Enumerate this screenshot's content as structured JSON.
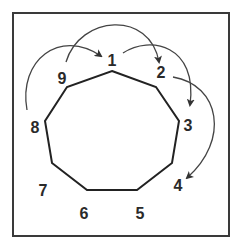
{
  "diagram": {
    "frame": {
      "x": 13,
      "y": 13,
      "width": 216,
      "height": 223,
      "stroke": "#3a3a3a"
    },
    "polygon": {
      "stroke": "#222222",
      "vertices": [
        {
          "id": "1",
          "x": 112,
          "y": 71
        },
        {
          "id": "2",
          "x": 156,
          "y": 87
        },
        {
          "id": "3",
          "x": 179,
          "y": 121
        },
        {
          "id": "4",
          "x": 172,
          "y": 163
        },
        {
          "id": "5",
          "x": 137,
          "y": 190
        },
        {
          "id": "6",
          "x": 87,
          "y": 190
        },
        {
          "id": "7",
          "x": 52,
          "y": 163
        },
        {
          "id": "8",
          "x": 45,
          "y": 121
        },
        {
          "id": "9",
          "x": 67,
          "y": 87
        }
      ]
    },
    "labels": [
      {
        "text": "1",
        "x": 112,
        "y": 66
      },
      {
        "text": "2",
        "x": 161,
        "y": 78
      },
      {
        "text": "3",
        "x": 188,
        "y": 131
      },
      {
        "text": "4",
        "x": 178,
        "y": 191
      },
      {
        "text": "5",
        "x": 140,
        "y": 219
      },
      {
        "text": "6",
        "x": 84,
        "y": 219
      },
      {
        "text": "7",
        "x": 43,
        "y": 196
      },
      {
        "text": "8",
        "x": 35,
        "y": 133
      },
      {
        "text": "9",
        "x": 62,
        "y": 84
      }
    ],
    "arrows": [
      {
        "from": "8",
        "to": "1",
        "path": "M 27 110 C 18 60, 60 28, 101 56"
      },
      {
        "from": "9",
        "to": "2",
        "path": "M 66 62 C 80 15, 150 10, 159 62"
      },
      {
        "from": "1",
        "to": "3",
        "path": "M 123 53 C 150 35, 198 45, 190 105"
      },
      {
        "from": "2",
        "to": "4",
        "path": "M 173 77 C 220 85, 230 140, 187 178"
      }
    ],
    "arrow_color": "#444444"
  }
}
